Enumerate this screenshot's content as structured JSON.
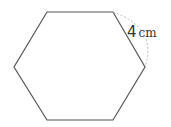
{
  "diagram": {
    "shape": "regular hexagon",
    "side_label": {
      "value": "4",
      "unit": "cm"
    },
    "colors": {
      "stroke": "#555555",
      "dashed_arc": "#bbbbbb"
    }
  }
}
